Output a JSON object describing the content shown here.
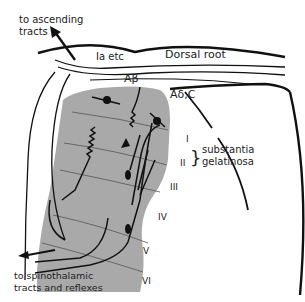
{
  "diagram": {
    "labels": {
      "ascending": [
        "to ascending",
        "tracts"
      ],
      "ia": "Ia etc",
      "dorsal_root": "Dorsal root",
      "abeta": "Aβ",
      "adelta": "Aδ,C",
      "substantia": [
        "substantia",
        "gelatinosa"
      ],
      "spinothalamic": [
        "to spinothalamic",
        "tracts and reflexes"
      ]
    },
    "laminae": [
      "I",
      "II",
      "III",
      "IV",
      "V",
      "VI"
    ],
    "colors": {
      "gray_matter": "#a9a9a9",
      "line": "#111111",
      "background": "#ffffff"
    }
  }
}
